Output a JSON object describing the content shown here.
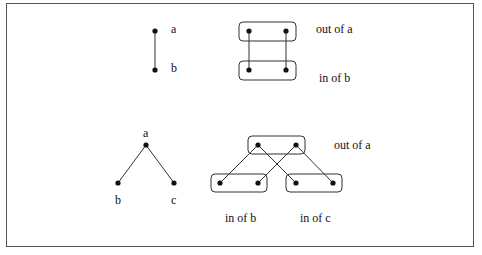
{
  "diagram": {
    "top_left": {
      "nodes": [
        {
          "id": "a",
          "label": "a"
        },
        {
          "id": "b",
          "label": "b"
        }
      ],
      "edges": [
        [
          "a",
          "b"
        ]
      ]
    },
    "top_right": {
      "labels": {
        "out_a": "out of a",
        "in_b": "in of b"
      },
      "groups": [
        "out of a",
        "in of b"
      ],
      "edges": [
        [
          "out_a.0",
          "in_b.0"
        ],
        [
          "out_a.1",
          "in_b.1"
        ]
      ]
    },
    "bottom_left": {
      "nodes": [
        {
          "id": "a",
          "label": "a"
        },
        {
          "id": "b",
          "label": "b"
        },
        {
          "id": "c",
          "label": "c"
        }
      ],
      "edges": [
        [
          "a",
          "b"
        ],
        [
          "a",
          "c"
        ]
      ]
    },
    "bottom_right": {
      "labels": {
        "out_a": "out of a",
        "in_b": "in of b",
        "in_c": "in of c"
      },
      "groups": [
        "out of a",
        "in of b",
        "in of c"
      ],
      "edges": [
        [
          "out_a.0",
          "in_b.0"
        ],
        [
          "out_a.0",
          "in_c.0"
        ],
        [
          "out_a.1",
          "in_b.1"
        ],
        [
          "out_a.1",
          "in_c.1"
        ]
      ]
    }
  }
}
